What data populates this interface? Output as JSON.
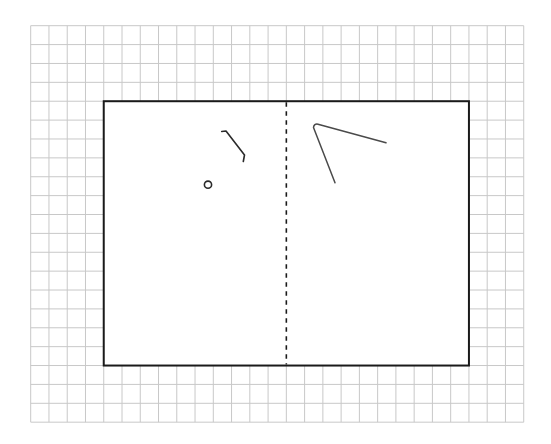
{
  "canvas": {
    "width": 551,
    "height": 444,
    "background": "#ffffff"
  },
  "grid": {
    "origin_x": 30.7,
    "origin_y": 25.7,
    "cols": 27,
    "rows": 21,
    "cell_w": 18.26,
    "cell_h": 18.88,
    "color": "#c8c8c8"
  },
  "sheet": {
    "col_start": 4,
    "col_end": 24,
    "row_start": 4,
    "row_end": 18,
    "border_color": "#1a1a1a"
  },
  "fold_line": {
    "col": 14,
    "style": "dashed"
  },
  "shapes": [
    {
      "id": "hook-stroke",
      "type": "polyline",
      "style": "stroke-dark",
      "points": [
        [
          221.7,
          131.5
        ],
        [
          226,
          131
        ],
        [
          244.5,
          155
        ],
        [
          243.3,
          161.5
        ]
      ]
    },
    {
      "id": "small-circle",
      "type": "circle",
      "style": "stroke-dark",
      "cx": 208,
      "cy": 184.7,
      "r": 3.6
    },
    {
      "id": "angle-stroke",
      "type": "path",
      "style": "stroke-gray",
      "d": "M386,142.7 L318,124.2 Q314,123.5 313.5,127.5 L335,182.7"
    }
  ]
}
